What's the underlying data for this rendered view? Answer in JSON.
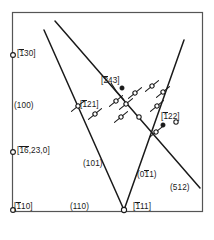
{
  "figure": {
    "type": "crystallographic-projection",
    "frame": {
      "x": 12,
      "y": 12,
      "width": 190,
      "height": 199,
      "stroke": "#555555"
    },
    "background": "#ffffff",
    "ink": "#1a1a1a"
  },
  "axis_markers": [
    {
      "name": "marker-T30",
      "cx": 13,
      "cy": 55,
      "r": 2.4
    },
    {
      "name": "marker-16-23-0",
      "cx": 13,
      "cy": 152,
      "r": 2.4
    },
    {
      "name": "marker-T10",
      "cx": 13,
      "cy": 210,
      "r": 2.4
    },
    {
      "name": "marker-T11",
      "cx": 124,
      "cy": 210,
      "r": 2.6
    }
  ],
  "edge_labels": [
    {
      "name": "label-T30",
      "pre": "[",
      "bar": "1",
      "post": "30]",
      "x": 17,
      "y": 50,
      "has_bar": true
    },
    {
      "name": "label-100",
      "pre": "(",
      "bar": "",
      "post": "100)",
      "x": 14,
      "y": 102,
      "has_bar": false
    },
    {
      "name": "label-16-23-0",
      "pre": "[",
      "bar": "16",
      "post": ",23,0]",
      "x": 17,
      "y": 147,
      "has_bar": true
    },
    {
      "name": "label-T10",
      "pre": "[",
      "bar": "1",
      "post": "10]",
      "x": 14,
      "y": 203,
      "has_bar": true
    },
    {
      "name": "label-110",
      "pre": "(",
      "bar": "",
      "post": "110)",
      "x": 70,
      "y": 203,
      "has_bar": false
    },
    {
      "name": "label-T11",
      "pre": "[",
      "bar": "1",
      "post": "11]",
      "x": 133,
      "y": 203,
      "has_bar": true
    },
    {
      "name": "label-512",
      "pre": "(",
      "bar": "",
      "post": "512)",
      "x": 170,
      "y": 184,
      "has_bar": false
    }
  ],
  "interior_labels": [
    {
      "name": "label-T243",
      "pre": "[",
      "bar": "2",
      "post": "43]",
      "x": 101,
      "y": 77,
      "has_bar": true
    },
    {
      "name": "label-T121",
      "pre": "[",
      "bar": "1",
      "post": "21]",
      "x": 80,
      "y": 101,
      "has_bar": true
    },
    {
      "name": "label-T22",
      "pre": "[",
      "bar": "1",
      "post": "22]",
      "x": 161,
      "y": 113,
      "has_bar": true
    },
    {
      "name": "label-101",
      "pre": "(",
      "bar": "",
      "post": "101)",
      "x": 83,
      "y": 160,
      "has_bar": false
    },
    {
      "name": "label-011",
      "pre": "(0",
      "bar": "1",
      "post": "1)",
      "x": 137,
      "y": 171,
      "has_bar": true
    }
  ],
  "trace_lines": [
    {
      "name": "trace-101",
      "x1": 44,
      "y1": 30,
      "x2": 124,
      "y2": 210,
      "width": 1.5
    },
    {
      "name": "trace-512",
      "x1": 55,
      "y1": 21,
      "x2": 200,
      "y2": 188,
      "width": 1.5
    },
    {
      "name": "trace-011",
      "x1": 124,
      "y1": 210,
      "x2": 184,
      "y2": 40,
      "width": 1.5
    }
  ],
  "leader_line": {
    "name": "leader-T243",
    "path": "M 111 83 Q 116 92 124 100",
    "width": 1.1
  },
  "markers": {
    "open_tick_label": "open circle with tangent tick",
    "filled_label": "filled circle",
    "open_label": "open circle",
    "open_tick": [
      {
        "cx": 78,
        "cy": 106,
        "a": -40
      },
      {
        "cx": 95,
        "cy": 114,
        "a": -40
      },
      {
        "cx": 116,
        "cy": 101,
        "a": -40
      },
      {
        "cx": 126,
        "cy": 104,
        "a": -40
      },
      {
        "cx": 121,
        "cy": 117,
        "a": -40
      },
      {
        "cx": 135,
        "cy": 93,
        "a": -40
      },
      {
        "cx": 152,
        "cy": 86,
        "a": -40
      },
      {
        "cx": 157,
        "cy": 106,
        "a": -40
      },
      {
        "cx": 156,
        "cy": 132,
        "a": -40
      },
      {
        "cx": 163,
        "cy": 92,
        "a": -40
      }
    ],
    "filled": [
      {
        "cx": 122,
        "cy": 88,
        "r": 2.2
      },
      {
        "cx": 163,
        "cy": 125,
        "r": 2.2
      }
    ],
    "open": [
      {
        "cx": 139,
        "cy": 117,
        "r": 2.2
      },
      {
        "cx": 176,
        "cy": 122,
        "r": 2.2
      }
    ]
  }
}
